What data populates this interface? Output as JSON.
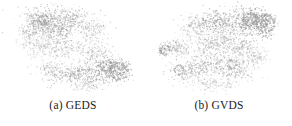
{
  "figure": {
    "background_color": "#ffffff",
    "point_color": "#9a9a9a",
    "caption_color": "#1c1c1c",
    "width": 292,
    "height": 126
  },
  "subfigures": [
    {
      "caption": "(a) GEDS",
      "label": "(a)",
      "name": "GEDS"
    },
    {
      "caption": "(b) GVDS",
      "label": "(b)",
      "name": "GVDS"
    }
  ],
  "chart_data": [
    {
      "type": "scatter",
      "title": "(a) GEDS",
      "xlabel": "",
      "ylabel": "",
      "xlim": [
        0,
        146
      ],
      "ylim": [
        0,
        96
      ],
      "grid": false,
      "legend": "none",
      "axes_visible": false,
      "marker_color": "#9a9a9a",
      "marker_size": 0.55,
      "marker_opacity": 0.5,
      "n_points": 2600,
      "seed": 17,
      "annotations": [],
      "clusters": [
        {
          "cx": 52,
          "cy": 26,
          "rx": 26,
          "ry": 17,
          "n": 520,
          "density": 1.0,
          "angle": 0
        },
        {
          "cx": 38,
          "cy": 22,
          "rx": 13,
          "ry": 11,
          "n": 210,
          "density": 1.1,
          "angle": 0
        },
        {
          "cx": 72,
          "cy": 18,
          "rx": 17,
          "ry": 10,
          "n": 200,
          "density": 0.9,
          "angle": 0
        },
        {
          "cx": 90,
          "cy": 30,
          "rx": 16,
          "ry": 14,
          "n": 190,
          "density": 0.8,
          "angle": 0
        },
        {
          "cx": 60,
          "cy": 48,
          "rx": 24,
          "ry": 14,
          "n": 260,
          "density": 0.85,
          "angle": 0
        },
        {
          "cx": 35,
          "cy": 45,
          "rx": 12,
          "ry": 12,
          "n": 120,
          "density": 0.7,
          "angle": 0
        },
        {
          "cx": 96,
          "cy": 56,
          "rx": 18,
          "ry": 12,
          "n": 180,
          "density": 0.8,
          "angle": 0
        },
        {
          "cx": 104,
          "cy": 70,
          "rx": 22,
          "ry": 11,
          "n": 300,
          "density": 1.2,
          "angle": -22
        },
        {
          "cx": 75,
          "cy": 74,
          "rx": 24,
          "ry": 8,
          "n": 250,
          "density": 1.1,
          "angle": -8
        },
        {
          "cx": 118,
          "cy": 72,
          "rx": 11,
          "ry": 10,
          "n": 170,
          "density": 1.3,
          "angle": 0
        },
        {
          "cx": 50,
          "cy": 70,
          "rx": 14,
          "ry": 7,
          "n": 110,
          "density": 0.8,
          "angle": -5
        },
        {
          "cx": 88,
          "cy": 84,
          "rx": 20,
          "ry": 7,
          "n": 130,
          "density": 0.7,
          "angle": 0
        },
        {
          "cx": 28,
          "cy": 34,
          "rx": 8,
          "ry": 9,
          "n": 70,
          "density": 0.8,
          "angle": 0
        }
      ],
      "rings": [
        {
          "cx": 119,
          "cy": 71,
          "r": 9,
          "n": 90
        },
        {
          "cx": 106,
          "cy": 66,
          "r": 6,
          "n": 55
        },
        {
          "cx": 44,
          "cy": 20,
          "r": 5,
          "n": 40
        },
        {
          "cx": 64,
          "cy": 32,
          "r": 4,
          "n": 30
        }
      ]
    },
    {
      "type": "scatter",
      "title": "(b) GVDS",
      "xlabel": "",
      "ylabel": "",
      "xlim": [
        0,
        146
      ],
      "ylim": [
        0,
        96
      ],
      "grid": false,
      "legend": "none",
      "axes_visible": false,
      "marker_color": "#9a9a9a",
      "marker_size": 0.55,
      "marker_opacity": 0.5,
      "n_points": 2600,
      "seed": 43,
      "annotations": [],
      "clusters": [
        {
          "cx": 78,
          "cy": 22,
          "rx": 26,
          "ry": 13,
          "n": 420,
          "density": 1.1,
          "angle": 0
        },
        {
          "cx": 104,
          "cy": 20,
          "rx": 16,
          "ry": 11,
          "n": 300,
          "density": 1.3,
          "angle": 0
        },
        {
          "cx": 118,
          "cy": 24,
          "rx": 11,
          "ry": 12,
          "n": 230,
          "density": 1.4,
          "angle": 0
        },
        {
          "cx": 50,
          "cy": 26,
          "rx": 16,
          "ry": 11,
          "n": 180,
          "density": 0.8,
          "angle": 0
        },
        {
          "cx": 70,
          "cy": 44,
          "rx": 26,
          "ry": 15,
          "n": 330,
          "density": 0.95,
          "angle": 0
        },
        {
          "cx": 96,
          "cy": 46,
          "rx": 18,
          "ry": 14,
          "n": 220,
          "density": 0.85,
          "angle": 0
        },
        {
          "cx": 30,
          "cy": 48,
          "rx": 12,
          "ry": 9,
          "n": 130,
          "density": 0.9,
          "angle": 0
        },
        {
          "cx": 18,
          "cy": 50,
          "rx": 7,
          "ry": 6,
          "n": 70,
          "density": 1.0,
          "angle": 0
        },
        {
          "cx": 60,
          "cy": 66,
          "rx": 26,
          "ry": 13,
          "n": 300,
          "density": 1.0,
          "angle": 0
        },
        {
          "cx": 92,
          "cy": 68,
          "rx": 18,
          "ry": 12,
          "n": 210,
          "density": 0.9,
          "angle": 0
        },
        {
          "cx": 40,
          "cy": 72,
          "rx": 16,
          "ry": 10,
          "n": 160,
          "density": 0.85,
          "angle": 0
        },
        {
          "cx": 70,
          "cy": 84,
          "rx": 22,
          "ry": 7,
          "n": 140,
          "density": 0.7,
          "angle": 0
        },
        {
          "cx": 112,
          "cy": 56,
          "rx": 10,
          "ry": 9,
          "n": 90,
          "density": 0.7,
          "angle": 0
        }
      ],
      "rings": [
        {
          "cx": 119,
          "cy": 23,
          "r": 10,
          "n": 110
        },
        {
          "cx": 104,
          "cy": 19,
          "r": 7,
          "n": 70
        },
        {
          "cx": 19,
          "cy": 50,
          "r": 5,
          "n": 45
        },
        {
          "cx": 33,
          "cy": 70,
          "r": 5,
          "n": 40
        },
        {
          "cx": 86,
          "cy": 64,
          "r": 5,
          "n": 35
        }
      ]
    }
  ]
}
